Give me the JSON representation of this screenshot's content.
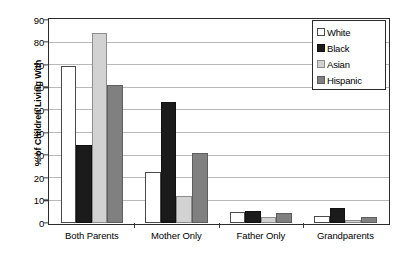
{
  "chart_data": {
    "type": "bar",
    "title": "",
    "xlabel": "",
    "ylabel": "% of Children Living With",
    "ylim": [
      0,
      90
    ],
    "ytick_step": 10,
    "yticks": [
      0,
      10,
      20,
      30,
      40,
      50,
      60,
      70,
      80,
      90
    ],
    "grid": true,
    "legend_position": "top-right",
    "categories": [
      "Both Parents",
      "Mother Only",
      "Father Only",
      "Grandparents"
    ],
    "series": [
      {
        "name": "White",
        "color": "#ffffff",
        "values": [
          69.5,
          22.5,
          5.0,
          3.0
        ]
      },
      {
        "name": "Black",
        "color": "#1b1b1b",
        "values": [
          34.5,
          53.5,
          5.5,
          6.5
        ]
      },
      {
        "name": "Asian",
        "color": "#d2d2d2",
        "values": [
          84.0,
          12.0,
          2.5,
          1.2
        ]
      },
      {
        "name": "Hispanic",
        "color": "#808080",
        "values": [
          61.0,
          31.0,
          4.5,
          2.8
        ]
      }
    ]
  },
  "axis": {
    "y_title": "% of Children Living With",
    "y_labels": [
      "0",
      "10",
      "20",
      "30",
      "40",
      "50",
      "60",
      "70",
      "80",
      "90"
    ],
    "x_labels": [
      "Both Parents",
      "Mother Only",
      "Father Only",
      "Grandparents"
    ]
  },
  "legend": {
    "items": [
      {
        "label": "White",
        "swatch": "swatch-white-icon"
      },
      {
        "label": "Black",
        "swatch": "swatch-black-icon"
      },
      {
        "label": "Asian",
        "swatch": "swatch-asian-icon"
      },
      {
        "label": "Hispanic",
        "swatch": "swatch-hispanic-icon"
      }
    ]
  }
}
